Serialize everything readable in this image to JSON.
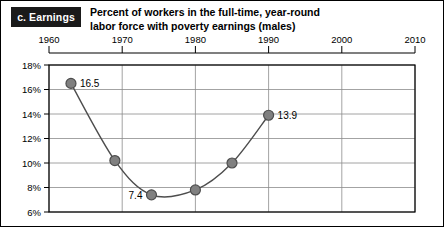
{
  "panel": {
    "tag": "c. Earnings"
  },
  "title": {
    "line1": "Percent of workers in the full-time, year-round",
    "line2": "labor force with poverty earnings (males)"
  },
  "colors": {
    "marker_fill": "#808080",
    "marker_stroke": "#4d4d4d",
    "line": "#4d4d4d",
    "grid": "#8c8c8c",
    "axis": "#000000",
    "tag_background": "#1a1a1a",
    "tag_text": "#ffffff"
  },
  "chart_data": {
    "type": "line",
    "title": "Percent of workers in the full-time, year-round labor force with poverty earnings (males)",
    "xlabel": "",
    "ylabel": "",
    "xlim": [
      1960,
      2010
    ],
    "ylim": [
      6,
      18
    ],
    "grid": true,
    "legend": "none",
    "x_ticks": [
      1960,
      1970,
      1980,
      1990,
      2000,
      2010
    ],
    "x_tick_labels": [
      "1960",
      "1970",
      "1980",
      "1990",
      "2000",
      "2010"
    ],
    "y_ticks": [
      6,
      8,
      10,
      12,
      14,
      16,
      18
    ],
    "y_tick_labels": [
      "6%",
      "8%",
      "10%",
      "12%",
      "14%",
      "16%",
      "18%"
    ],
    "series": [
      {
        "name": "Poverty earnings rate (males)",
        "x": [
          1963,
          1969,
          1974,
          1980,
          1985,
          1990
        ],
        "values": [
          16.5,
          10.2,
          7.4,
          7.8,
          10.0,
          13.9
        ]
      }
    ],
    "annotations": [
      {
        "text": "16.5",
        "x": 1963,
        "y": 16.5,
        "position": "right"
      },
      {
        "text": "7.4",
        "x": 1974,
        "y": 7.4,
        "position": "left"
      },
      {
        "text": "13.9",
        "x": 1990,
        "y": 13.9,
        "position": "right"
      }
    ]
  }
}
